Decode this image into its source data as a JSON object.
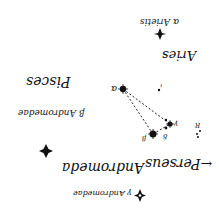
{
  "chart": {
    "orientation": "rotated 180 degrees",
    "constellations": {
      "aries": "Aries",
      "pisces": "Pisces",
      "andromeda": "Andromeda",
      "perseus": "Perseus"
    },
    "stars": {
      "alpha_arietis": "α Arietis",
      "beta_andromedae": "β Andromedae",
      "gamma_andromedae": "γ Andromedae",
      "alpha": "α",
      "beta": "β",
      "gamma": "γ",
      "delta": "δ",
      "iota": "ι",
      "r": "R"
    },
    "perseus_arrow": "←"
  }
}
